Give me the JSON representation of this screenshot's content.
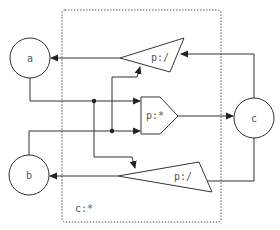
{
  "diagram": {
    "container_label": "c:*",
    "nodes": {
      "a": {
        "label": "a",
        "type": "circle"
      },
      "b": {
        "label": "b",
        "type": "circle"
      },
      "c": {
        "label": "c",
        "type": "circle"
      },
      "upper_proc": {
        "label": "p:/",
        "type": "triangle"
      },
      "center_proc": {
        "label": "p:*",
        "type": "pentagon"
      },
      "lower_proc": {
        "label": "p:/",
        "type": "triangle"
      }
    },
    "edges": [
      {
        "from": "a",
        "to": "center_proc"
      },
      {
        "from": "b",
        "to": "center_proc"
      },
      {
        "from": "center_proc",
        "to": "c"
      },
      {
        "from": "c",
        "to": "upper_proc"
      },
      {
        "from": "c",
        "to": "lower_proc"
      },
      {
        "from": "upper_proc",
        "to": "a"
      },
      {
        "from": "lower_proc",
        "to": "b"
      },
      {
        "from": "b-branch",
        "to": "upper_proc"
      },
      {
        "from": "a-branch",
        "to": "lower_proc"
      }
    ],
    "colors": {
      "stroke": "#333333",
      "text": "#555555",
      "container_border": "#555555",
      "background": "#ffffff"
    }
  }
}
